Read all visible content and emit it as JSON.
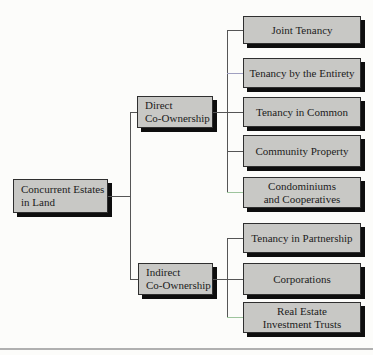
{
  "colors": {
    "background": "#fcfcfa",
    "box_fill": "#c8c8c5",
    "box_border": "#2f2f2f",
    "box_shadow": "#0e0e0e",
    "connector": "#555555",
    "connector_green": "#9dc49d",
    "connector_purple": "#a0a0c0",
    "bottom_rule": "#b0b0b0"
  },
  "root": {
    "lines": [
      "Concurrent Estates",
      "in Land"
    ]
  },
  "branches": [
    {
      "lines": [
        "Direct",
        "Co-Ownership"
      ]
    },
    {
      "lines": [
        "Indirect",
        "Co-Ownership"
      ]
    }
  ],
  "leaves": [
    {
      "lines": [
        "Joint Tenancy"
      ]
    },
    {
      "lines": [
        "Tenancy by the Entirety"
      ]
    },
    {
      "lines": [
        "Tenancy in Common"
      ]
    },
    {
      "lines": [
        "Community Property"
      ]
    },
    {
      "lines": [
        "Condominiums",
        "and Cooperatives"
      ]
    },
    {
      "lines": [
        "Tenancy in Partnership"
      ]
    },
    {
      "lines": [
        "Corporations"
      ]
    },
    {
      "lines": [
        "Real Estate",
        "Investment Trusts"
      ]
    }
  ]
}
